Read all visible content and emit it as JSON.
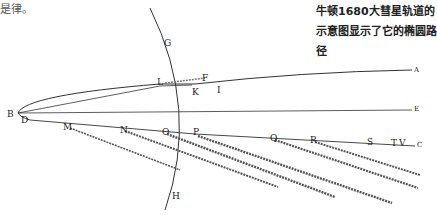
{
  "header": {
    "top_left_text": "是律。"
  },
  "caption": {
    "text": "牛顿1680大彗星轨道的示意图显示了它的椭圆路径"
  },
  "diagram": {
    "labels": {
      "G": "G",
      "H": "H",
      "L": "L",
      "F": "F",
      "K": "K",
      "I": "I",
      "A": "A",
      "E": "E",
      "C": "C",
      "B": "B",
      "D": "D",
      "M": "M",
      "N": "N",
      "O": "O",
      "P": "P",
      "Q": "Q",
      "R": "R",
      "S": "S",
      "T": "T",
      "V": "V"
    },
    "colors": {
      "ink": "#333333",
      "tail": "#555555"
    }
  }
}
